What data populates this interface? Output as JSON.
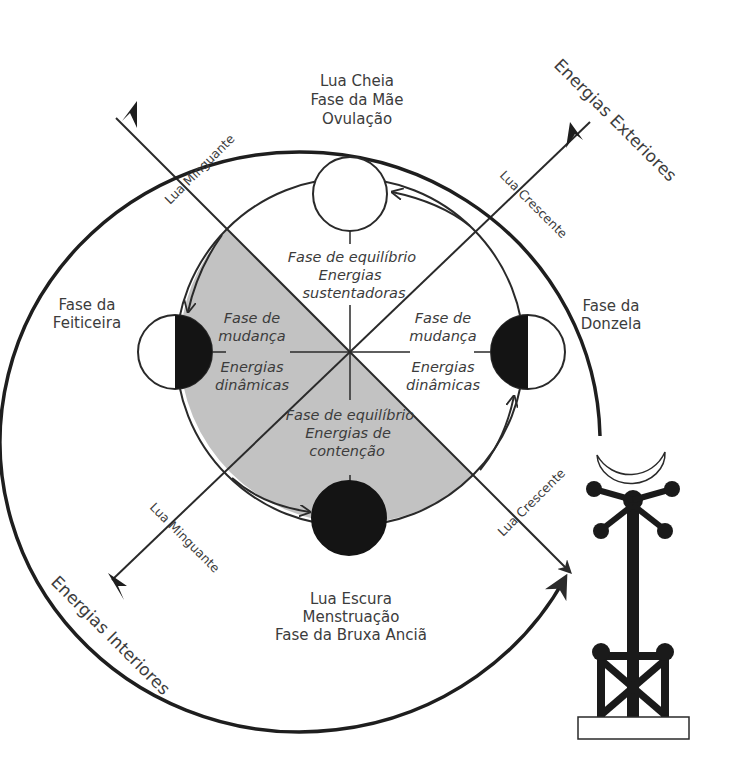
{
  "diagram": {
    "colors": {
      "line": "#2a2a2a",
      "shaded_region": "#c2c2c2",
      "text": "#3c3c3c",
      "dark_moon": "#141414",
      "background": "#ffffff"
    },
    "top": {
      "line1": "Lua Cheia",
      "line2": "Fase da Mãe",
      "line3": "Ovulação"
    },
    "bottom": {
      "line1": "Lua Escura",
      "line2": "Menstruação",
      "line3": "Fase da Bruxa Anciã"
    },
    "left": {
      "line1": "Fase da",
      "line2": "Feiticeira"
    },
    "right": {
      "line1": "Fase da",
      "line2": "Donzela"
    },
    "outer_labels": {
      "exterior": "Energias Exteriores",
      "interior": "Energias Interiores"
    },
    "diagonal_labels": {
      "upper_left": "Lua Minguante",
      "upper_right": "Lua Crescente",
      "lower_left": "Lua Minguante",
      "lower_right": "Lua Crescente"
    },
    "inner_quadrants": {
      "top": {
        "line1": "Fase de equilíbrio",
        "line2": "Energias",
        "line3": "sustentadoras"
      },
      "bottom": {
        "line1": "Fase de equilíbrio",
        "line2": "Energias de",
        "line3": "contenção"
      },
      "left": {
        "line1": "Fase de",
        "line2": "mudança",
        "line3": "Energias",
        "line4": "dinâmicas"
      },
      "right": {
        "line1": "Fase de",
        "line2": "mudança",
        "line3": "Energias",
        "line4": "dinâmicas"
      }
    },
    "moons": [
      {
        "position": "top",
        "phase": "full-moon"
      },
      {
        "position": "right",
        "phase": "waxing-half-moon"
      },
      {
        "position": "bottom",
        "phase": "dark-moon"
      },
      {
        "position": "left",
        "phase": "waning-half-moon"
      }
    ],
    "icons": [
      "crescent-moon-staff-icon"
    ]
  }
}
